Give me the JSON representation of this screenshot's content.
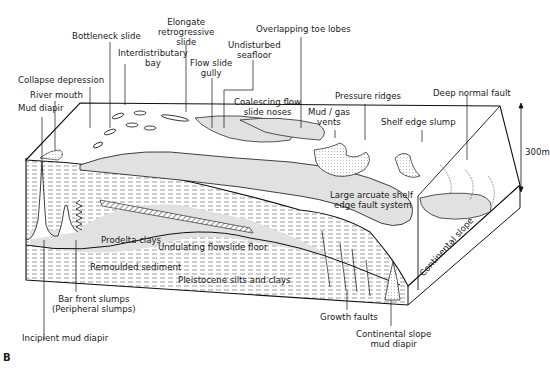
{
  "figure": {
    "panel_letter": "B",
    "scale_bar": "300m",
    "colors": {
      "ink": "#1a1a1a",
      "background": "#ffffff",
      "stipple": "#c8c8c8"
    }
  },
  "top_labels": [
    {
      "id": "bottleneck",
      "text": "Bottleneck slide"
    },
    {
      "id": "elongate",
      "lines": [
        "Elongate",
        "retrogressive",
        "slide"
      ]
    },
    {
      "id": "interdistributary",
      "lines": [
        "Interdistributary",
        "bay"
      ]
    },
    {
      "id": "overlapping",
      "text": "Overlapping toe lobes"
    },
    {
      "id": "undisturbed",
      "lines": [
        "Undisturbed",
        "seafloor"
      ]
    },
    {
      "id": "flowslide",
      "lines": [
        "Flow slide",
        "gully"
      ]
    },
    {
      "id": "collapse",
      "text": "Collapse depression"
    },
    {
      "id": "river",
      "text": "River mouth"
    },
    {
      "id": "muddiapir",
      "text": "Mud diapir"
    },
    {
      "id": "pressure",
      "text": "Pressure ridges"
    },
    {
      "id": "deepfault",
      "text": "Deep normal fault"
    },
    {
      "id": "coalescing",
      "lines": [
        "Coalescing flow",
        "slide noses"
      ]
    },
    {
      "id": "mudgas",
      "lines": [
        "Mud / gas",
        "vents"
      ]
    },
    {
      "id": "shelfslump",
      "text": "Shelf edge slump"
    }
  ],
  "inner_labels": {
    "large_arcuate": [
      "Large arcuate shelf",
      "edge fault system"
    ],
    "prodelta": "Prodelta clays",
    "undulating": "Undulating flowslide floor",
    "remoulded": "Remoulded sediment",
    "pleistocene": "Pleistocene silts and clays",
    "continental_slope": "Continental slope"
  },
  "bottom_labels": {
    "bar_front": [
      "Bar front slumps",
      "(Peripheral slumps)"
    ],
    "incipient": "Incipient mud diapir",
    "growth": "Growth faults",
    "slope_diapir": [
      "Continental slope",
      "mud diapir"
    ]
  }
}
